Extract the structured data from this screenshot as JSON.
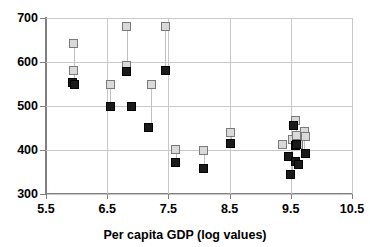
{
  "chart_data": {
    "type": "scatter",
    "title": "",
    "xlabel": "Per capita GDP (log values)",
    "ylabel": "",
    "xlim": [
      5.5,
      10.5
    ],
    "ylim": [
      300,
      700
    ],
    "xticks": [
      "5.5",
      "6.5",
      "7.5",
      "8.5",
      "9.5",
      "10.5"
    ],
    "yticks": [
      "300",
      "400",
      "500",
      "600",
      "700"
    ],
    "grid": true,
    "legend": "none",
    "series": [
      {
        "name": "open-square",
        "marker": "open square",
        "color": "#d9d9d9",
        "points": [
          {
            "x": 5.95,
            "y": 642
          },
          {
            "x": 5.95,
            "y": 580
          },
          {
            "x": 6.55,
            "y": 548
          },
          {
            "x": 6.82,
            "y": 681
          },
          {
            "x": 6.82,
            "y": 592
          },
          {
            "x": 7.22,
            "y": 548
          },
          {
            "x": 7.45,
            "y": 681
          },
          {
            "x": 7.62,
            "y": 402
          },
          {
            "x": 8.08,
            "y": 400
          },
          {
            "x": 8.52,
            "y": 440
          },
          {
            "x": 9.36,
            "y": 412
          },
          {
            "x": 9.52,
            "y": 425
          },
          {
            "x": 9.58,
            "y": 466
          },
          {
            "x": 9.6,
            "y": 432
          },
          {
            "x": 9.62,
            "y": 412
          },
          {
            "x": 9.72,
            "y": 443
          },
          {
            "x": 9.74,
            "y": 430
          }
        ]
      },
      {
        "name": "filled-square",
        "marker": "filled square",
        "color": "#1a1a1a",
        "points": [
          {
            "x": 5.93,
            "y": 553
          },
          {
            "x": 5.97,
            "y": 550
          },
          {
            "x": 6.55,
            "y": 498
          },
          {
            "x": 6.82,
            "y": 578
          },
          {
            "x": 6.9,
            "y": 500
          },
          {
            "x": 7.18,
            "y": 452
          },
          {
            "x": 7.45,
            "y": 580
          },
          {
            "x": 7.62,
            "y": 372
          },
          {
            "x": 8.08,
            "y": 358
          },
          {
            "x": 8.52,
            "y": 415
          },
          {
            "x": 9.46,
            "y": 385
          },
          {
            "x": 9.5,
            "y": 345
          },
          {
            "x": 9.55,
            "y": 455
          },
          {
            "x": 9.57,
            "y": 410
          },
          {
            "x": 9.58,
            "y": 375
          },
          {
            "x": 9.6,
            "y": 412
          },
          {
            "x": 9.63,
            "y": 368
          },
          {
            "x": 9.74,
            "y": 393
          }
        ]
      }
    ],
    "pairs": [
      {
        "x": 5.95,
        "top": 642,
        "bottom": 580
      },
      {
        "x": 5.95,
        "top": 580,
        "bottom": 551
      },
      {
        "x": 6.55,
        "top": 548,
        "bottom": 498
      },
      {
        "x": 6.82,
        "top": 681,
        "bottom": 578
      },
      {
        "x": 7.22,
        "top": 548,
        "bottom": 452
      },
      {
        "x": 7.45,
        "top": 681,
        "bottom": 580
      },
      {
        "x": 7.62,
        "top": 402,
        "bottom": 372
      },
      {
        "x": 8.08,
        "top": 400,
        "bottom": 358
      },
      {
        "x": 8.52,
        "top": 440,
        "bottom": 415
      },
      {
        "x": 9.58,
        "top": 466,
        "bottom": 410
      },
      {
        "x": 9.52,
        "top": 425,
        "bottom": 345
      },
      {
        "x": 9.72,
        "top": 443,
        "bottom": 393
      }
    ]
  }
}
